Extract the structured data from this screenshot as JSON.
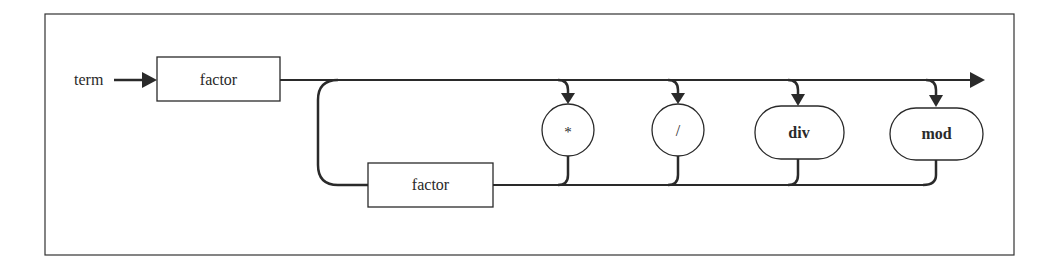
{
  "diagram": {
    "type": "syntax-diagram",
    "entry_label": "term",
    "nodes": {
      "factor_first": {
        "label": "factor",
        "shape": "rectangle"
      },
      "factor_loop": {
        "label": "factor",
        "shape": "rectangle"
      },
      "op_multiply": {
        "label": "*",
        "shape": "circle"
      },
      "op_divide": {
        "label": "/",
        "shape": "circle"
      },
      "op_div": {
        "label": "div",
        "shape": "rounded"
      },
      "op_mod": {
        "label": "mod",
        "shape": "rounded"
      }
    },
    "colors": {
      "line": "#2a2a2a",
      "background": "#ffffff"
    }
  }
}
